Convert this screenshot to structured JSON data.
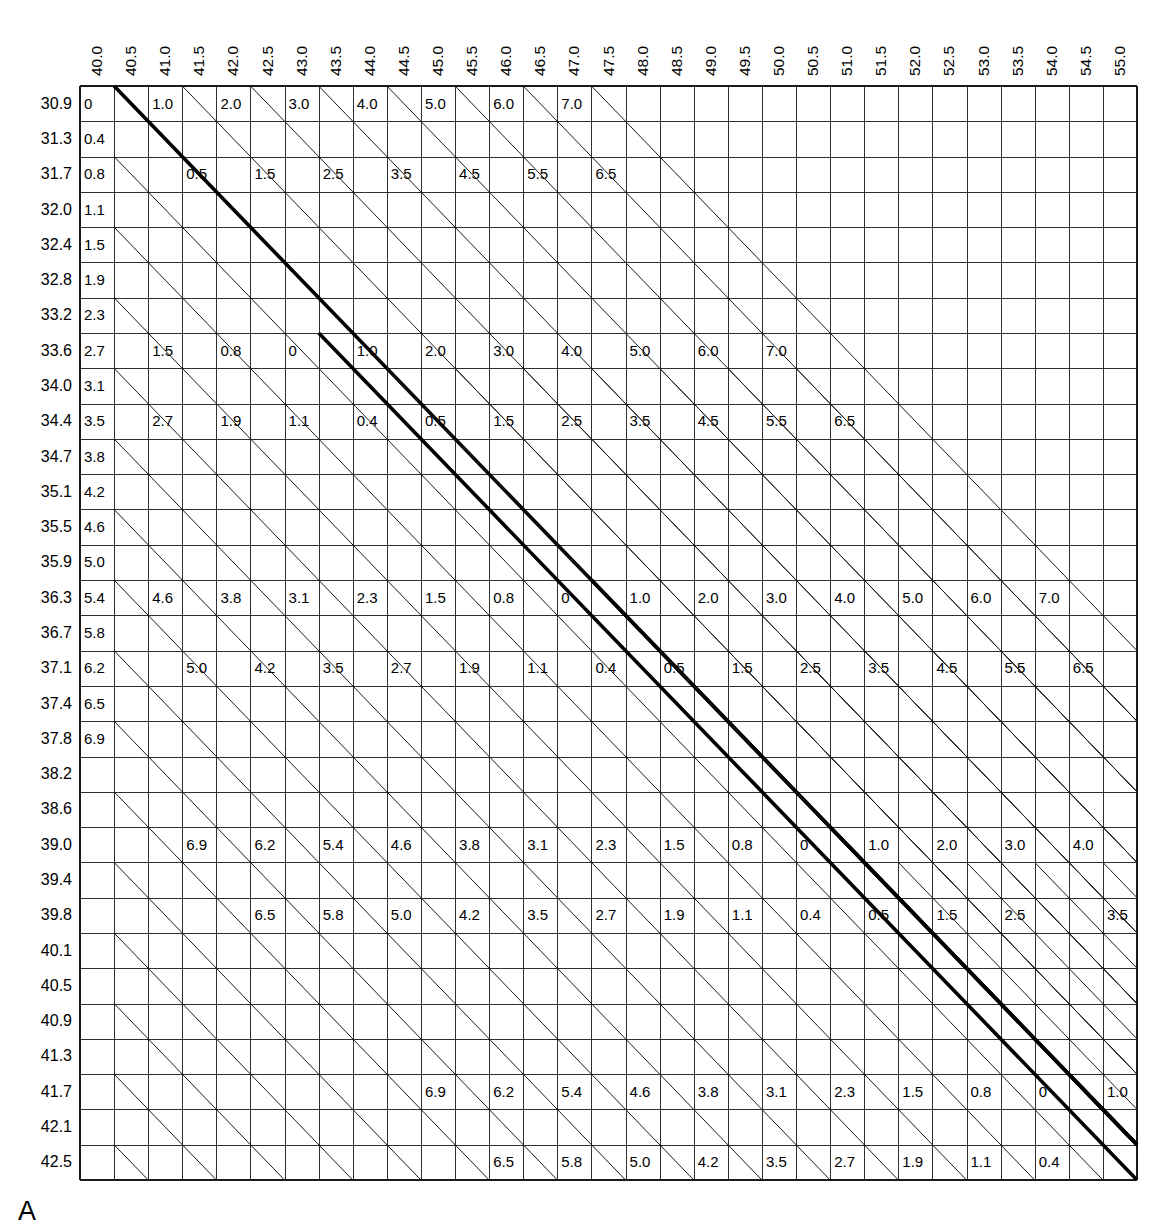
{
  "figure": {
    "panel_label": "A",
    "type": "nomogram-grid-table"
  },
  "axes": {
    "column_headers": [
      "40.0",
      "40.5",
      "41.0",
      "41.5",
      "42.0",
      "42.5",
      "43.0",
      "43.5",
      "44.0",
      "44.5",
      "45.0",
      "45.5",
      "46.0",
      "46.5",
      "47.0",
      "47.5",
      "48.0",
      "48.5",
      "49.0",
      "49.5",
      "50.0",
      "50.5",
      "51.0",
      "51.5",
      "52.0",
      "52.5",
      "53.0",
      "53.5",
      "54.0",
      "54.5",
      "55.0"
    ],
    "row_headers": [
      "30.9",
      "31.3",
      "31.7",
      "32.0",
      "32.4",
      "32.8",
      "33.2",
      "33.6",
      "34.0",
      "34.4",
      "34.7",
      "35.1",
      "35.5",
      "35.9",
      "36.3",
      "36.7",
      "37.1",
      "37.4",
      "37.8",
      "38.2",
      "38.6",
      "39.0",
      "39.4",
      "39.8",
      "40.1",
      "40.5",
      "40.9",
      "41.3",
      "41.7",
      "42.1",
      "42.5"
    ]
  },
  "style": {
    "grid_line_color": "#1a1a1a",
    "bold_line_color": "#000000",
    "background": "#ffffff"
  },
  "chart_data": {
    "type": "table",
    "title": "",
    "subtitle": "",
    "xlabel": "",
    "ylabel": "",
    "grid": true,
    "legend": "none",
    "x": [
      "40.0",
      "40.5",
      "41.0",
      "41.5",
      "42.0",
      "42.5",
      "43.0",
      "43.5",
      "44.0",
      "44.5",
      "45.0",
      "45.5",
      "46.0",
      "46.5",
      "47.0",
      "47.5",
      "48.0",
      "48.5",
      "49.0",
      "49.5",
      "50.0",
      "50.5",
      "51.0",
      "51.5",
      "52.0",
      "52.5",
      "53.0",
      "53.5",
      "54.0",
      "54.5",
      "55.0"
    ],
    "y": [
      "30.9",
      "31.3",
      "31.7",
      "32.0",
      "32.4",
      "32.8",
      "33.2",
      "33.6",
      "34.0",
      "34.4",
      "34.7",
      "35.1",
      "35.5",
      "35.9",
      "36.3",
      "36.7",
      "37.1",
      "37.4",
      "37.8",
      "38.2",
      "38.6",
      "39.0",
      "39.4",
      "39.8",
      "40.1",
      "40.5",
      "40.9",
      "41.3",
      "41.7",
      "42.1",
      "42.5"
    ],
    "n_cols": 31,
    "n_rows": 31,
    "labelled_cells": [
      {
        "row": 0,
        "col": 0,
        "value": "0"
      },
      {
        "row": 0,
        "col": 2,
        "value": "1.0"
      },
      {
        "row": 0,
        "col": 4,
        "value": "2.0"
      },
      {
        "row": 0,
        "col": 6,
        "value": "3.0"
      },
      {
        "row": 0,
        "col": 8,
        "value": "4.0"
      },
      {
        "row": 0,
        "col": 10,
        "value": "5.0"
      },
      {
        "row": 0,
        "col": 12,
        "value": "6.0"
      },
      {
        "row": 0,
        "col": 14,
        "value": "7.0"
      },
      {
        "row": 1,
        "col": 0,
        "value": "0.4"
      },
      {
        "row": 2,
        "col": 0,
        "value": "0.8"
      },
      {
        "row": 2,
        "col": 3,
        "value": "0.5"
      },
      {
        "row": 2,
        "col": 5,
        "value": "1.5"
      },
      {
        "row": 2,
        "col": 7,
        "value": "2.5"
      },
      {
        "row": 2,
        "col": 9,
        "value": "3.5"
      },
      {
        "row": 2,
        "col": 11,
        "value": "4.5"
      },
      {
        "row": 2,
        "col": 13,
        "value": "5.5"
      },
      {
        "row": 2,
        "col": 15,
        "value": "6.5"
      },
      {
        "row": 3,
        "col": 0,
        "value": "1.1"
      },
      {
        "row": 4,
        "col": 0,
        "value": "1.5"
      },
      {
        "row": 5,
        "col": 0,
        "value": "1.9"
      },
      {
        "row": 6,
        "col": 0,
        "value": "2.3"
      },
      {
        "row": 7,
        "col": 0,
        "value": "2.7"
      },
      {
        "row": 7,
        "col": 2,
        "value": "1.5"
      },
      {
        "row": 7,
        "col": 4,
        "value": "0.8"
      },
      {
        "row": 7,
        "col": 6,
        "value": "0"
      },
      {
        "row": 7,
        "col": 8,
        "value": "1.0"
      },
      {
        "row": 7,
        "col": 10,
        "value": "2.0"
      },
      {
        "row": 7,
        "col": 12,
        "value": "3.0"
      },
      {
        "row": 7,
        "col": 14,
        "value": "4.0"
      },
      {
        "row": 7,
        "col": 16,
        "value": "5.0"
      },
      {
        "row": 7,
        "col": 18,
        "value": "6.0"
      },
      {
        "row": 7,
        "col": 20,
        "value": "7.0"
      },
      {
        "row": 8,
        "col": 0,
        "value": "3.1"
      },
      {
        "row": 9,
        "col": 0,
        "value": "3.5"
      },
      {
        "row": 9,
        "col": 2,
        "value": "2.7"
      },
      {
        "row": 9,
        "col": 4,
        "value": "1.9"
      },
      {
        "row": 9,
        "col": 6,
        "value": "1.1"
      },
      {
        "row": 9,
        "col": 8,
        "value": "0.4"
      },
      {
        "row": 9,
        "col": 10,
        "value": "0.5"
      },
      {
        "row": 9,
        "col": 12,
        "value": "1.5"
      },
      {
        "row": 9,
        "col": 14,
        "value": "2.5"
      },
      {
        "row": 9,
        "col": 16,
        "value": "3.5"
      },
      {
        "row": 9,
        "col": 18,
        "value": "4.5"
      },
      {
        "row": 9,
        "col": 20,
        "value": "5.5"
      },
      {
        "row": 9,
        "col": 22,
        "value": "6.5"
      },
      {
        "row": 10,
        "col": 0,
        "value": "3.8"
      },
      {
        "row": 11,
        "col": 0,
        "value": "4.2"
      },
      {
        "row": 12,
        "col": 0,
        "value": "4.6"
      },
      {
        "row": 13,
        "col": 0,
        "value": "5.0"
      },
      {
        "row": 14,
        "col": 0,
        "value": "5.4"
      },
      {
        "row": 14,
        "col": 2,
        "value": "4.6"
      },
      {
        "row": 14,
        "col": 4,
        "value": "3.8"
      },
      {
        "row": 14,
        "col": 6,
        "value": "3.1"
      },
      {
        "row": 14,
        "col": 8,
        "value": "2.3"
      },
      {
        "row": 14,
        "col": 10,
        "value": "1.5"
      },
      {
        "row": 14,
        "col": 12,
        "value": "0.8"
      },
      {
        "row": 14,
        "col": 14,
        "value": "0"
      },
      {
        "row": 14,
        "col": 16,
        "value": "1.0"
      },
      {
        "row": 14,
        "col": 18,
        "value": "2.0"
      },
      {
        "row": 14,
        "col": 20,
        "value": "3.0"
      },
      {
        "row": 14,
        "col": 22,
        "value": "4.0"
      },
      {
        "row": 14,
        "col": 24,
        "value": "5.0"
      },
      {
        "row": 14,
        "col": 26,
        "value": "6.0"
      },
      {
        "row": 14,
        "col": 28,
        "value": "7.0"
      },
      {
        "row": 15,
        "col": 0,
        "value": "5.8"
      },
      {
        "row": 16,
        "col": 0,
        "value": "6.2"
      },
      {
        "row": 16,
        "col": 3,
        "value": "5.0"
      },
      {
        "row": 16,
        "col": 5,
        "value": "4.2"
      },
      {
        "row": 16,
        "col": 7,
        "value": "3.5"
      },
      {
        "row": 16,
        "col": 9,
        "value": "2.7"
      },
      {
        "row": 16,
        "col": 11,
        "value": "1.9"
      },
      {
        "row": 16,
        "col": 13,
        "value": "1.1"
      },
      {
        "row": 16,
        "col": 15,
        "value": "0.4"
      },
      {
        "row": 16,
        "col": 17,
        "value": "0.5"
      },
      {
        "row": 16,
        "col": 19,
        "value": "1.5"
      },
      {
        "row": 16,
        "col": 21,
        "value": "2.5"
      },
      {
        "row": 16,
        "col": 23,
        "value": "3.5"
      },
      {
        "row": 16,
        "col": 25,
        "value": "4.5"
      },
      {
        "row": 16,
        "col": 27,
        "value": "5.5"
      },
      {
        "row": 16,
        "col": 29,
        "value": "6.5"
      },
      {
        "row": 17,
        "col": 0,
        "value": "6.5"
      },
      {
        "row": 18,
        "col": 0,
        "value": "6.9"
      },
      {
        "row": 21,
        "col": 3,
        "value": "6.9"
      },
      {
        "row": 21,
        "col": 5,
        "value": "6.2"
      },
      {
        "row": 21,
        "col": 7,
        "value": "5.4"
      },
      {
        "row": 21,
        "col": 9,
        "value": "4.6"
      },
      {
        "row": 21,
        "col": 11,
        "value": "3.8"
      },
      {
        "row": 21,
        "col": 13,
        "value": "3.1"
      },
      {
        "row": 21,
        "col": 15,
        "value": "2.3"
      },
      {
        "row": 21,
        "col": 17,
        "value": "1.5"
      },
      {
        "row": 21,
        "col": 19,
        "value": "0.8"
      },
      {
        "row": 21,
        "col": 21,
        "value": "0"
      },
      {
        "row": 21,
        "col": 23,
        "value": "1.0"
      },
      {
        "row": 21,
        "col": 25,
        "value": "2.0"
      },
      {
        "row": 21,
        "col": 27,
        "value": "3.0"
      },
      {
        "row": 21,
        "col": 29,
        "value": "4.0"
      },
      {
        "row": 23,
        "col": 5,
        "value": "6.5"
      },
      {
        "row": 23,
        "col": 7,
        "value": "5.8"
      },
      {
        "row": 23,
        "col": 9,
        "value": "5.0"
      },
      {
        "row": 23,
        "col": 11,
        "value": "4.2"
      },
      {
        "row": 23,
        "col": 13,
        "value": "3.5"
      },
      {
        "row": 23,
        "col": 15,
        "value": "2.7"
      },
      {
        "row": 23,
        "col": 17,
        "value": "1.9"
      },
      {
        "row": 23,
        "col": 19,
        "value": "1.1"
      },
      {
        "row": 23,
        "col": 21,
        "value": "0.4"
      },
      {
        "row": 23,
        "col": 23,
        "value": "0.5"
      },
      {
        "row": 23,
        "col": 25,
        "value": "1.5"
      },
      {
        "row": 23,
        "col": 27,
        "value": "2.5"
      },
      {
        "row": 23,
        "col": 30,
        "value": "3.5"
      },
      {
        "row": 28,
        "col": 10,
        "value": "6.9"
      },
      {
        "row": 28,
        "col": 12,
        "value": "6.2"
      },
      {
        "row": 28,
        "col": 14,
        "value": "5.4"
      },
      {
        "row": 28,
        "col": 16,
        "value": "4.6"
      },
      {
        "row": 28,
        "col": 18,
        "value": "3.8"
      },
      {
        "row": 28,
        "col": 20,
        "value": "3.1"
      },
      {
        "row": 28,
        "col": 22,
        "value": "2.3"
      },
      {
        "row": 28,
        "col": 24,
        "value": "1.5"
      },
      {
        "row": 28,
        "col": 26,
        "value": "0.8"
      },
      {
        "row": 28,
        "col": 28,
        "value": "0"
      },
      {
        "row": 28,
        "col": 30,
        "value": "1.0"
      },
      {
        "row": 30,
        "col": 12,
        "value": "6.5"
      },
      {
        "row": 30,
        "col": 14,
        "value": "5.8"
      },
      {
        "row": 30,
        "col": 16,
        "value": "5.0"
      },
      {
        "row": 30,
        "col": 18,
        "value": "4.2"
      },
      {
        "row": 30,
        "col": 20,
        "value": "3.5"
      },
      {
        "row": 30,
        "col": 22,
        "value": "2.7"
      },
      {
        "row": 30,
        "col": 24,
        "value": "1.9"
      },
      {
        "row": 30,
        "col": 26,
        "value": "1.1"
      },
      {
        "row": 30,
        "col": 28,
        "value": "0.4"
      }
    ],
    "diagonals": [
      {
        "start_row": 0,
        "start_col": 1,
        "length": 30,
        "bold": true
      },
      {
        "start_row": 0,
        "start_col": 3,
        "length": 28,
        "bold": false
      },
      {
        "start_row": 0,
        "start_col": 5,
        "length": 26,
        "bold": false
      },
      {
        "start_row": 0,
        "start_col": 7,
        "length": 24,
        "bold": false
      },
      {
        "start_row": 0,
        "start_col": 9,
        "length": 22,
        "bold": false
      },
      {
        "start_row": 0,
        "start_col": 11,
        "length": 20,
        "bold": false
      },
      {
        "start_row": 0,
        "start_col": 13,
        "length": 18,
        "bold": false
      },
      {
        "start_row": 0,
        "start_col": 15,
        "length": 16,
        "bold": false
      },
      {
        "start_row": 2,
        "start_col": 1,
        "length": 29,
        "bold": false
      },
      {
        "start_row": 4,
        "start_col": 1,
        "length": 27,
        "bold": false
      },
      {
        "start_row": 6,
        "start_col": 1,
        "length": 25,
        "bold": false
      },
      {
        "start_row": 7,
        "start_col": 7,
        "length": 24,
        "bold": true
      },
      {
        "start_row": 8,
        "start_col": 1,
        "length": 23,
        "bold": false
      },
      {
        "start_row": 8,
        "start_col": 9,
        "length": 22,
        "bold": false
      },
      {
        "start_row": 8,
        "start_col": 11,
        "length": 20,
        "bold": false
      },
      {
        "start_row": 8,
        "start_col": 13,
        "length": 18,
        "bold": false
      },
      {
        "start_row": 8,
        "start_col": 15,
        "length": 16,
        "bold": false
      },
      {
        "start_row": 8,
        "start_col": 17,
        "length": 14,
        "bold": false
      },
      {
        "start_row": 8,
        "start_col": 19,
        "length": 12,
        "bold": false
      },
      {
        "start_row": 8,
        "start_col": 21,
        "length": 10,
        "bold": false
      },
      {
        "start_row": 10,
        "start_col": 1,
        "length": 21,
        "bold": false
      },
      {
        "start_row": 12,
        "start_col": 1,
        "length": 19,
        "bold": false
      },
      {
        "start_row": 14,
        "start_col": 1,
        "length": 17,
        "bold": false
      },
      {
        "start_row": 14,
        "start_col": 15,
        "length": 17,
        "bold": true
      },
      {
        "start_row": 16,
        "start_col": 1,
        "length": 15,
        "bold": false
      },
      {
        "start_row": 16,
        "start_col": 17,
        "length": 15,
        "bold": false
      },
      {
        "start_row": 16,
        "start_col": 19,
        "length": 13,
        "bold": false
      },
      {
        "start_row": 16,
        "start_col": 21,
        "length": 11,
        "bold": false
      },
      {
        "start_row": 16,
        "start_col": 23,
        "length": 9,
        "bold": false
      },
      {
        "start_row": 16,
        "start_col": 25,
        "length": 7,
        "bold": false
      },
      {
        "start_row": 16,
        "start_col": 27,
        "length": 5,
        "bold": false
      },
      {
        "start_row": 16,
        "start_col": 29,
        "length": 3,
        "bold": false
      },
      {
        "start_row": 18,
        "start_col": 1,
        "length": 13,
        "bold": false
      },
      {
        "start_row": 20,
        "start_col": 1,
        "length": 11,
        "bold": false
      },
      {
        "start_row": 21,
        "start_col": 22,
        "length": 10,
        "bold": true
      },
      {
        "start_row": 22,
        "start_col": 1,
        "length": 9,
        "bold": false
      },
      {
        "start_row": 22,
        "start_col": 24,
        "length": 8,
        "bold": false
      },
      {
        "start_row": 22,
        "start_col": 26,
        "length": 6,
        "bold": false
      },
      {
        "start_row": 22,
        "start_col": 28,
        "length": 4,
        "bold": false
      },
      {
        "start_row": 22,
        "start_col": 30,
        "length": 2,
        "bold": false
      },
      {
        "start_row": 24,
        "start_col": 1,
        "length": 7,
        "bold": false
      },
      {
        "start_row": 26,
        "start_col": 1,
        "length": 5,
        "bold": false
      },
      {
        "start_row": 28,
        "start_col": 1,
        "length": 3,
        "bold": false
      },
      {
        "start_row": 28,
        "start_col": 29,
        "length": 3,
        "bold": true
      },
      {
        "start_row": 30,
        "start_col": 1,
        "length": 1,
        "bold": false
      }
    ]
  }
}
